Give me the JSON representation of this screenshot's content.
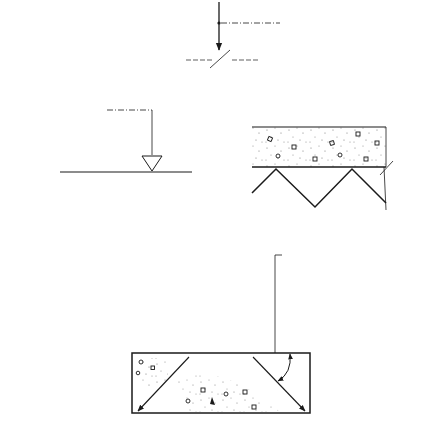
{
  "diagram": {
    "title": "",
    "type": "construction-section",
    "colors": {
      "ink": "#1a1a1a",
      "background": "#ffffff",
      "concrete_speckle": "#7a7a7a"
    },
    "annotations": {
      "top_load": {
        "lines": [
          "combined loadings",
          "collected by and",
          "transmitted down",
          "the wall to the",
          "foundations"
        ]
      },
      "ground_level": {
        "text": "ground level",
        "symbol": "triangle-datum-marker"
      },
      "angle_note": {
        "lines": [
          "loads transmitted",
          "through the mass",
          "concrete foundation",
          "at an angle of 45°"
        ],
        "angle_degrees": 45
      }
    },
    "elements": {
      "wall": {
        "material": "brickwork",
        "courses_visible": 14,
        "load_arrows_in_wall": 4
      },
      "floor_slab": {
        "material": "concrete",
        "side": "right"
      },
      "void_under_slab": {
        "symbol": "zigzag-break-line"
      },
      "ground": {
        "material": "earth-hatching",
        "side": "left"
      },
      "foundation": {
        "material": "mass-concrete",
        "diagonal_load_arrows": 2
      },
      "soil_reaction_arrows": {
        "count": 7,
        "direction": "up"
      }
    }
  }
}
